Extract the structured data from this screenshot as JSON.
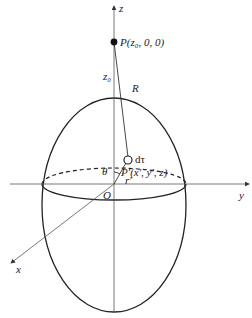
{
  "diagram": {
    "type": "3d-geometry",
    "labels": {
      "z_axis": "z",
      "y_axis": "y",
      "x_axis": "x",
      "point_p": "P(z₀, 0, 0)",
      "z0": "z₀",
      "distance_r": "R",
      "volume_element": "dτ",
      "point_p_prime": "P′(x′, y′, z)",
      "angle": "θ",
      "r_prime": "r′",
      "origin": "O"
    },
    "colors": {
      "stroke": "#222222",
      "axis": "#555555",
      "background": "#ffffff"
    }
  }
}
